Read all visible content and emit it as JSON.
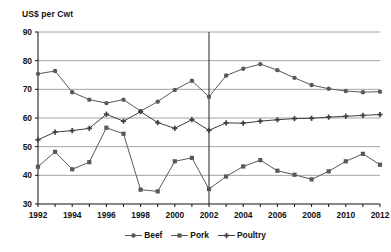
{
  "chart_data": {
    "type": "line",
    "title": "",
    "ylabel": "US$ per Cwt",
    "xlabel": "",
    "ylim": [
      30,
      90
    ],
    "ytick_step": 10,
    "yticks": [
      30,
      40,
      50,
      60,
      70,
      80,
      90
    ],
    "xlim": [
      1992,
      2012
    ],
    "xticks_labeled": [
      1992,
      1994,
      1996,
      1998,
      2000,
      2002,
      2004,
      2006,
      2008,
      2010,
      2012
    ],
    "x": [
      1992,
      1993,
      1994,
      1995,
      1996,
      1997,
      1998,
      1999,
      2000,
      2001,
      2002,
      2003,
      2004,
      2005,
      2006,
      2007,
      2008,
      2009,
      2010,
      2011,
      2012
    ],
    "grid": "horizontal",
    "legend_position": "bottom",
    "annotations": [
      {
        "type": "vline",
        "x": 2002,
        "label": ""
      }
    ],
    "series": [
      {
        "name": "Beef",
        "marker": "circle",
        "color": "#595959",
        "values": [
          75.4,
          76.4,
          69.0,
          66.4,
          65.2,
          66.4,
          62.4,
          65.7,
          69.8,
          73.0,
          67.4,
          74.8,
          77.2,
          78.8,
          76.7,
          74.0,
          71.5,
          70.2,
          69.4,
          69.0,
          69.2
        ]
      },
      {
        "name": "Pork",
        "marker": "square",
        "color": "#595959",
        "values": [
          43.0,
          48.2,
          42.1,
          44.6,
          56.6,
          54.5,
          35.0,
          34.4,
          44.9,
          46.1,
          35.2,
          39.6,
          43.1,
          45.3,
          41.6,
          40.2,
          38.6,
          41.4,
          44.9,
          47.5,
          43.7
        ]
      },
      {
        "name": "Poultry",
        "marker": "cross",
        "color": "#3f3f3f",
        "values": [
          52.4,
          55.1,
          55.6,
          56.4,
          61.3,
          58.9,
          62.2,
          58.4,
          56.4,
          59.4,
          55.7,
          58.3,
          58.2,
          58.9,
          59.4,
          59.8,
          59.9,
          60.3,
          60.6,
          60.9,
          61.2
        ]
      }
    ]
  },
  "legend": {
    "items": [
      {
        "label": "Beef"
      },
      {
        "label": "Pork"
      },
      {
        "label": "Poultry"
      }
    ]
  }
}
